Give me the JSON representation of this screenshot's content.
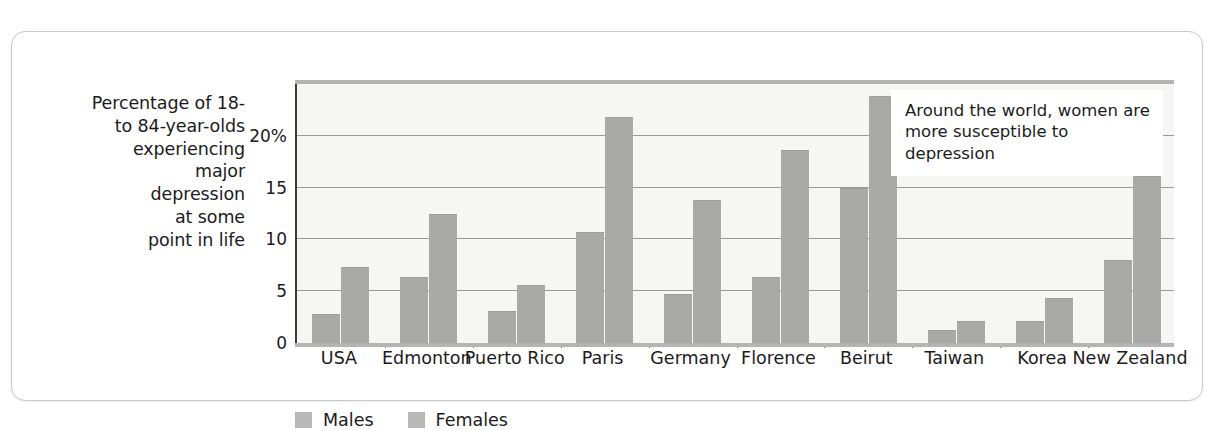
{
  "chart_data": {
    "type": "bar",
    "title": "",
    "subtitle": "",
    "ylabel": "Percentage of 18- to 84-year-olds experiencing major depression at some point in life",
    "xlabel": "",
    "ylim": [
      0,
      25
    ],
    "grid": true,
    "legend_position": "bottom-left",
    "ytick_labels": [
      "20%",
      "15",
      "10",
      "5",
      "0"
    ],
    "ytick_values": [
      20,
      15,
      10,
      5,
      0
    ],
    "categories": [
      "USA",
      "Edmonton",
      "Puerto Rico",
      "Paris",
      "Germany",
      "Florence",
      "Beirut",
      "Taiwan",
      "Korea",
      "New Zealand"
    ],
    "series": [
      {
        "name": "Males",
        "color": "#a9a9a7",
        "values": [
          2.8,
          6.4,
          3.1,
          10.7,
          4.7,
          6.4,
          15.0,
          1.3,
          2.1,
          8.0
        ]
      },
      {
        "name": "Females",
        "color": "#a9a9a7",
        "values": [
          7.3,
          12.5,
          5.6,
          21.8,
          13.8,
          18.6,
          23.8,
          2.1,
          4.3,
          16.1
        ]
      }
    ],
    "annotations": [
      {
        "text": "Around the world, women are more susceptible to depression"
      }
    ]
  },
  "axis_title": {
    "lines": [
      "Percentage of 18-",
      "to 84-year-olds",
      "experiencing",
      "major",
      "depression",
      "at some",
      "point in life"
    ]
  },
  "annotation": {
    "text": "Around the world, women are more susceptible to depression"
  },
  "legend": {
    "items": [
      {
        "label": "Males"
      },
      {
        "label": "Females"
      }
    ]
  }
}
